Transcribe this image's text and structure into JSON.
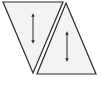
{
  "diagram": {
    "colors": {
      "stroke": "#2a2a2a",
      "fill": "#f3f3f3",
      "background": "#ffffff"
    },
    "shapes": [
      {
        "id": "inverted-triangle",
        "points": "3,2 63,2 33,73",
        "arrow": {
          "x": 33,
          "y1": 14,
          "y2": 43
        }
      },
      {
        "id": "upright-triangle",
        "points": "66,3 96,74 37,74",
        "arrow": {
          "x": 67,
          "y1": 32,
          "y2": 61
        }
      }
    ],
    "caption": ""
  }
}
